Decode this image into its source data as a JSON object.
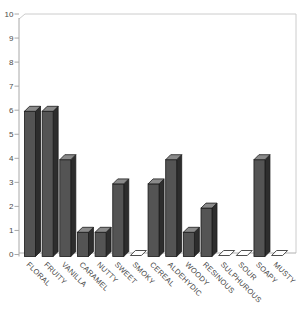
{
  "chart_data": {
    "type": "bar",
    "style": "3d-column",
    "title": "",
    "xlabel": "",
    "ylabel": "",
    "categories": [
      "FLORAL",
      "FRUITY",
      "VANILLA",
      "CARAMEL",
      "NUTTY",
      "SWEET",
      "SMOKY",
      "CEREAL",
      "ALDEHYDIC",
      "WOODY",
      "RESINOUS",
      "SULPHUROUS",
      "SOUR",
      "SOAPY",
      "MUSTY"
    ],
    "values": [
      6,
      6,
      4,
      1,
      1,
      3,
      0,
      3,
      4,
      1,
      2,
      0,
      0,
      4,
      0
    ],
    "ylim": [
      0,
      10
    ],
    "yticks": [
      0,
      1,
      2,
      3,
      4,
      5,
      6,
      7,
      8,
      9,
      10
    ],
    "grid": false,
    "legend": null,
    "colors": {
      "bar_front": "#545454",
      "bar_top": "#8a8a8a",
      "bar_side": "#2d2d2d",
      "bar_outline": "#1a1a1a",
      "zero_marker_fill": "#ffffff",
      "zero_marker_outline": "#3a3a3a",
      "axis_line": "#a8a8a8",
      "wall_border": "#cccccc",
      "floor_line": "#b0b0b0",
      "label_text": "#4a4a4a"
    }
  }
}
